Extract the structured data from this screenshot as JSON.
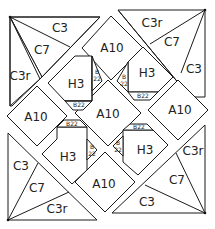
{
  "diagram": {
    "type": "quilt-block-piecing-diagram",
    "line_color": "#1a1a1a",
    "background": "#ffffff",
    "corners": {
      "top_left": {
        "outer": "C3",
        "middle": "C7",
        "inner": "C3r"
      },
      "top_right": {
        "outer": "C3r",
        "middle": "C7",
        "inner": "C3"
      },
      "bottom_left": {
        "outer": "C3",
        "middle": "C7",
        "inner": "C3r"
      },
      "bottom_right": {
        "outer": "C3r",
        "middle": "C7",
        "inner": "C3"
      }
    },
    "squares": {
      "top": "A10",
      "left": "A10",
      "right": "A10",
      "bottom": "A10",
      "center": "A10"
    },
    "h_units": [
      {
        "label": "H3",
        "b_top": "B22",
        "b_side": "B 22"
      },
      {
        "label": "H3",
        "b_top": "B22",
        "b_side": "B 22"
      },
      {
        "label": "H3",
        "b_top": "B22",
        "b_side": "B 22"
      },
      {
        "label": "H3",
        "b_top": "B22",
        "b_side": "B 22"
      }
    ],
    "labels": {
      "tl_c3": "C3",
      "tl_c7": "C7",
      "tl_c3r": "C3r",
      "tr_c3r": "C3r",
      "tr_c7": "C7",
      "tr_c3": "C3",
      "bl_c3": "C3",
      "bl_c7": "C7",
      "bl_c3r": "C3r",
      "br_c3r": "C3r",
      "br_c7": "C7",
      "br_c3": "C3",
      "a10_top": "A10",
      "a10_left": "A10",
      "a10_right": "A10",
      "a10_bottom": "A10",
      "a10_center": "A10",
      "h3_tl": "H3",
      "h3_tr": "H3",
      "h3_bl": "H3",
      "h3_br": "H3",
      "b22": "B22",
      "b": "B",
      "n22": "22"
    }
  }
}
